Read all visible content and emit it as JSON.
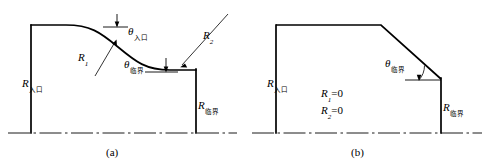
{
  "figure": {
    "background_color": "#ffffff",
    "line_color": "#000000",
    "panels": [
      {
        "id": "a",
        "caption": "(a)",
        "description": "smooth curved profile",
        "labels": {
          "r_inlet": "R",
          "r_inlet_sub": "入口",
          "r_critical": "R",
          "r_critical_sub": "临界",
          "r1": "R",
          "r1_sub": "1",
          "r2": "R",
          "r2_sub": "2",
          "theta_inlet": "θ",
          "theta_inlet_sub": "入口",
          "theta_critical": "θ",
          "theta_critical_sub": "临界"
        }
      },
      {
        "id": "b",
        "caption": "(b)",
        "description": "sharp-cornered simplified profile",
        "labels": {
          "r_inlet": "R",
          "r_inlet_sub": "入口",
          "r_critical": "R",
          "r_critical_sub": "临界",
          "theta_critical": "θ",
          "theta_critical_sub": "临界",
          "r1_eq": "R",
          "r1_eq_sub": "1",
          "r1_eq_val": "=0",
          "r2_eq": "R",
          "r2_eq_sub": "2",
          "r2_eq_val": "=0"
        }
      }
    ]
  }
}
